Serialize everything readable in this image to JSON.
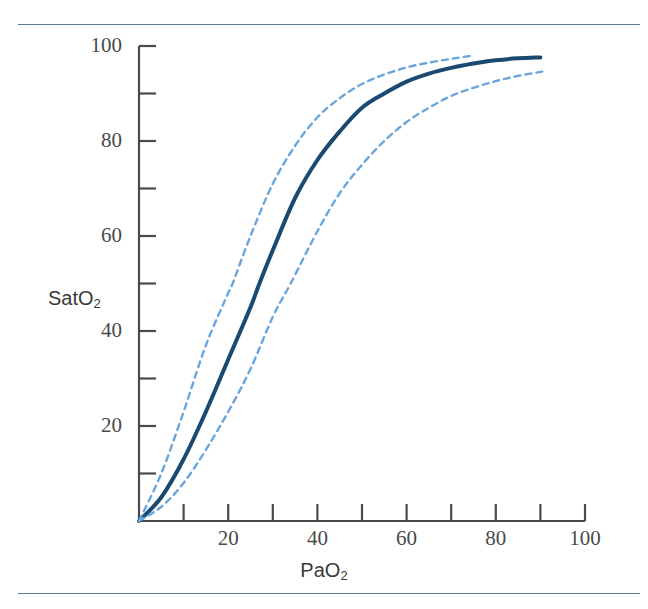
{
  "figure": {
    "background_color": "#ffffff",
    "rule_color": "#5b7e96",
    "rules": [
      "top-rule",
      "bottom-rule"
    ]
  },
  "axes": {
    "x": {
      "label": "PaO",
      "label_sub": "2",
      "ticks_major": [
        0,
        20,
        40,
        60,
        80,
        100
      ],
      "tick_labels": [
        "",
        "20",
        "40",
        "60",
        "80",
        "100"
      ],
      "ticks_minor": [
        10,
        30,
        50,
        70,
        90
      ],
      "range": [
        0,
        100
      ]
    },
    "y": {
      "label": "SatO",
      "label_sub": "2",
      "ticks_major": [
        0,
        20,
        40,
        60,
        80,
        100
      ],
      "tick_labels": [
        "",
        "20",
        "40",
        "60",
        "80",
        "100"
      ],
      "ticks_minor": [
        10,
        30,
        50,
        70,
        90
      ],
      "range": [
        0,
        100
      ]
    }
  },
  "chart_data": {
    "type": "line",
    "title": "",
    "xlabel": "PaO2",
    "ylabel": "SatO2",
    "xlim": [
      0,
      100
    ],
    "ylim": [
      0,
      100
    ],
    "grid": false,
    "legend": "none",
    "series": [
      {
        "name": "normal-curve",
        "style": "solid",
        "color": "#1a4a72",
        "width": 4,
        "p50": 27,
        "x": [
          0,
          5,
          10,
          15,
          20,
          25,
          27,
          30,
          35,
          40,
          45,
          50,
          55,
          60,
          65,
          70,
          75,
          80,
          85,
          90
        ],
        "y": [
          0,
          5,
          13,
          23,
          34,
          45,
          50,
          57,
          68,
          76,
          82,
          87,
          90,
          92.5,
          94.2,
          95.4,
          96.3,
          97.0,
          97.4,
          97.6
        ]
      },
      {
        "name": "left-shifted-curve",
        "style": "dashed",
        "color": "#6aa6dc",
        "width": 2.4,
        "p50": 21,
        "x": [
          0,
          5,
          10,
          15,
          20,
          21,
          25,
          30,
          35,
          40,
          45,
          50,
          55,
          60,
          65,
          70,
          75
        ],
        "y": [
          0,
          10,
          23,
          37,
          48,
          50,
          60,
          71,
          79,
          85,
          89,
          92,
          94,
          95.5,
          96.5,
          97.3,
          98.0
        ]
      },
      {
        "name": "right-shifted-curve",
        "style": "dashed",
        "color": "#6aa6dc",
        "width": 2.4,
        "p50": 34,
        "x": [
          0,
          5,
          10,
          15,
          20,
          25,
          30,
          34,
          40,
          45,
          50,
          55,
          60,
          65,
          70,
          75,
          80,
          85,
          91
        ],
        "y": [
          0,
          3,
          8,
          15,
          23,
          32,
          43,
          50,
          61,
          69,
          75,
          80,
          84,
          87,
          89.5,
          91.2,
          92.6,
          93.7,
          94.7
        ]
      }
    ]
  }
}
